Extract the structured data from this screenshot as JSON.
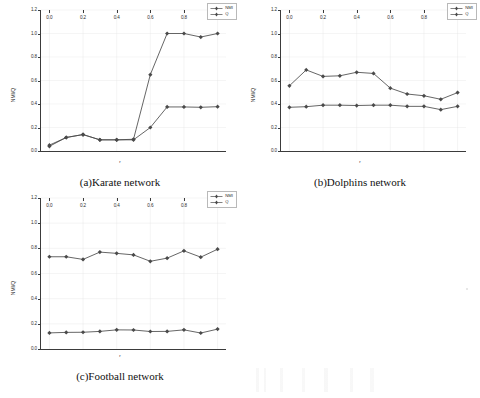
{
  "figure": {
    "panel_count": 3,
    "series_names": [
      "NMI",
      "Q"
    ],
    "marker_color": "#4a4a4a",
    "line_color": "#4a4a4a",
    "grid_color": "#e3e3e3",
    "axis_color": "#3b3b3b"
  },
  "charts": [
    {
      "id": "a",
      "caption": "(a)Karate network",
      "chart_data": {
        "type": "line",
        "title": "(a)Karate network",
        "xlabel": "r",
        "ylabel": "NMI/Q",
        "x": [
          0.0,
          0.1,
          0.2,
          0.3,
          0.4,
          0.5,
          0.6,
          0.7,
          0.8,
          0.9,
          1.0
        ],
        "xticks": [
          "0.0",
          "0.2",
          "0.4",
          "0.6",
          "0.8",
          "1.0"
        ],
        "yticks": [
          "0.0",
          "0.2",
          "0.4",
          "0.6",
          "0.8",
          "1.0",
          "1.2"
        ],
        "xlim": [
          -0.05,
          1.05
        ],
        "ylim": [
          0.0,
          1.2
        ],
        "grid": true,
        "legend_position": "upper right",
        "series": [
          {
            "name": "NMI",
            "values": [
              0.05,
              0.115,
              0.14,
              0.095,
              0.095,
              0.1,
              0.65,
              1.0,
              1.0,
              0.97,
              1.0
            ]
          },
          {
            "name": "Q",
            "values": [
              0.04,
              0.115,
              0.14,
              0.095,
              0.095,
              0.095,
              0.2,
              0.375,
              0.375,
              0.372,
              0.377
            ]
          }
        ]
      }
    },
    {
      "id": "b",
      "caption": "(b)Dolphins  network",
      "chart_data": {
        "type": "line",
        "title": "(b)Dolphins  network",
        "xlabel": "r",
        "ylabel": "NMI/Q",
        "x": [
          0.0,
          0.1,
          0.2,
          0.3,
          0.4,
          0.5,
          0.6,
          0.7,
          0.8,
          0.9,
          1.0
        ],
        "xticks": [
          "0.0",
          "0.2",
          "0.4",
          "0.6",
          "0.8",
          "1.0"
        ],
        "yticks": [
          "0.0",
          "0.2",
          "0.4",
          "0.6",
          "0.8",
          "1.0",
          "1.2"
        ],
        "xlim": [
          -0.05,
          1.05
        ],
        "ylim": [
          0.0,
          1.2
        ],
        "grid": true,
        "legend_position": "upper right",
        "series": [
          {
            "name": "NMI",
            "values": [
              0.555,
              0.69,
              0.635,
              0.64,
              0.67,
              0.66,
              0.535,
              0.485,
              0.47,
              0.44,
              0.497
            ]
          },
          {
            "name": "Q",
            "values": [
              0.372,
              0.377,
              0.39,
              0.39,
              0.387,
              0.39,
              0.39,
              0.38,
              0.38,
              0.352,
              0.38
            ]
          }
        ]
      }
    },
    {
      "id": "c",
      "caption": "(c)Football network",
      "chart_data": {
        "type": "line",
        "title": "(c)Football network",
        "xlabel": "r",
        "ylabel": "NMI/Q",
        "x": [
          0.0,
          0.1,
          0.2,
          0.3,
          0.4,
          0.5,
          0.6,
          0.7,
          0.8,
          0.9,
          1.0
        ],
        "xticks": [
          "0.0",
          "0.2",
          "0.4",
          "0.6",
          "0.8",
          "1.0"
        ],
        "yticks": [
          "0.0",
          "0.2",
          "0.4",
          "0.6",
          "0.8",
          "1.0",
          "1.2"
        ],
        "xlim": [
          -0.05,
          1.05
        ],
        "ylim": [
          0.0,
          1.2
        ],
        "grid": true,
        "legend_position": "upper right",
        "series": [
          {
            "name": "NMI",
            "values": [
              0.733,
              0.733,
              0.712,
              0.77,
              0.76,
              0.748,
              0.697,
              0.722,
              0.78,
              0.73,
              0.793
            ]
          },
          {
            "name": "Q",
            "values": [
              0.128,
              0.132,
              0.133,
              0.14,
              0.152,
              0.151,
              0.139,
              0.14,
              0.152,
              0.127,
              0.158
            ]
          }
        ]
      }
    }
  ]
}
